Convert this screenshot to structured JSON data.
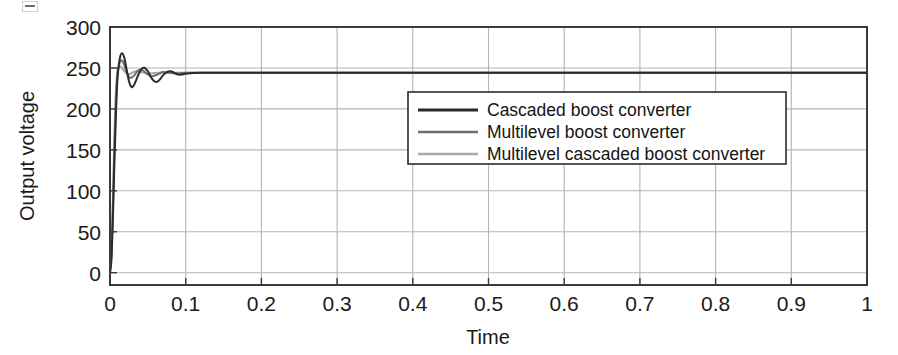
{
  "chart_data": {
    "type": "line",
    "title": "",
    "xlabel": "Time",
    "ylabel": "Output voltage",
    "xlim": [
      0,
      1
    ],
    "ylim": [
      -15,
      300
    ],
    "grid": true,
    "legend_position": "upper-center-right",
    "x_ticks": [
      "0",
      "0.1",
      "0.2",
      "0.3",
      "0.4",
      "0.5",
      "0.6",
      "0.7",
      "0.8",
      "0.9",
      "1"
    ],
    "x_tick_values": [
      0,
      0.1,
      0.2,
      0.3,
      0.4,
      0.5,
      0.6,
      0.7,
      0.8,
      0.9,
      1
    ],
    "y_ticks": [
      "0",
      "50",
      "100",
      "150",
      "200",
      "250",
      "300"
    ],
    "y_tick_values": [
      0,
      50,
      100,
      150,
      200,
      250,
      300
    ],
    "series": [
      {
        "name": "Cascaded boost converter",
        "color": "#2b2b2b",
        "width": 2.0,
        "steady_state": 244,
        "overshoot_peak": 268,
        "settling_time": 0.09,
        "x": [
          0,
          0.002,
          0.004,
          0.006,
          0.008,
          0.01,
          0.013,
          0.016,
          0.019,
          0.022,
          0.025,
          0.028,
          0.031,
          0.034,
          0.038,
          0.042,
          0.046,
          0.05,
          0.054,
          0.058,
          0.062,
          0.066,
          0.07,
          0.075,
          0.08,
          0.085,
          0.09,
          0.095,
          0.1,
          0.12,
          0.15,
          0.2,
          0.3,
          0.4,
          0.5,
          0.6,
          0.7,
          0.8,
          0.9,
          1.0
        ],
        "y": [
          0,
          18,
          72,
          140,
          198,
          238,
          262,
          268,
          262,
          248,
          234,
          227,
          228,
          234,
          243,
          249,
          250,
          246,
          239,
          234,
          233,
          236,
          241,
          245,
          246,
          244,
          242,
          242,
          243,
          244,
          244,
          244,
          244,
          244,
          244,
          244,
          244,
          244,
          244,
          244
        ]
      },
      {
        "name": "Multilevel boost converter",
        "color": "#6e6e6e",
        "width": 2.0,
        "steady_state": 244,
        "overshoot_peak": 259,
        "settling_time": 0.07,
        "x": [
          0,
          0.002,
          0.004,
          0.006,
          0.008,
          0.01,
          0.013,
          0.016,
          0.019,
          0.022,
          0.025,
          0.028,
          0.032,
          0.036,
          0.04,
          0.045,
          0.05,
          0.055,
          0.06,
          0.065,
          0.07,
          0.08,
          0.09,
          0.1,
          0.15,
          0.2,
          0.3,
          0.4,
          0.5,
          0.6,
          0.7,
          0.8,
          0.9,
          1.0
        ],
        "y": [
          0,
          22,
          86,
          158,
          212,
          243,
          257,
          259,
          253,
          245,
          239,
          238,
          241,
          246,
          248,
          246,
          242,
          240,
          241,
          243,
          245,
          244,
          243,
          244,
          244,
          244,
          244,
          244,
          244,
          244,
          244,
          244,
          244,
          244
        ]
      },
      {
        "name": "Multilevel cascaded boost converter",
        "color": "#a8a8a8",
        "width": 2.0,
        "steady_state": 244,
        "overshoot_peak": 252,
        "settling_time": 0.05,
        "x": [
          0,
          0.002,
          0.004,
          0.006,
          0.008,
          0.01,
          0.013,
          0.016,
          0.019,
          0.023,
          0.027,
          0.031,
          0.035,
          0.04,
          0.045,
          0.05,
          0.06,
          0.07,
          0.08,
          0.1,
          0.15,
          0.2,
          0.3,
          0.4,
          0.5,
          0.6,
          0.7,
          0.8,
          0.9,
          1.0
        ],
        "y": [
          0,
          26,
          98,
          176,
          226,
          248,
          252,
          250,
          246,
          243,
          243,
          245,
          246,
          245,
          244,
          243,
          244,
          244,
          244,
          244,
          244,
          244,
          244,
          244,
          244,
          244,
          244,
          244,
          244,
          244
        ]
      }
    ]
  },
  "legend": {
    "items": [
      {
        "label": "Cascaded boost converter"
      },
      {
        "label": "Multilevel boost converter"
      },
      {
        "label": "Multilevel cascaded boost converter"
      }
    ]
  },
  "axes": {
    "x_title": "Time",
    "y_title": "Output voltage"
  }
}
